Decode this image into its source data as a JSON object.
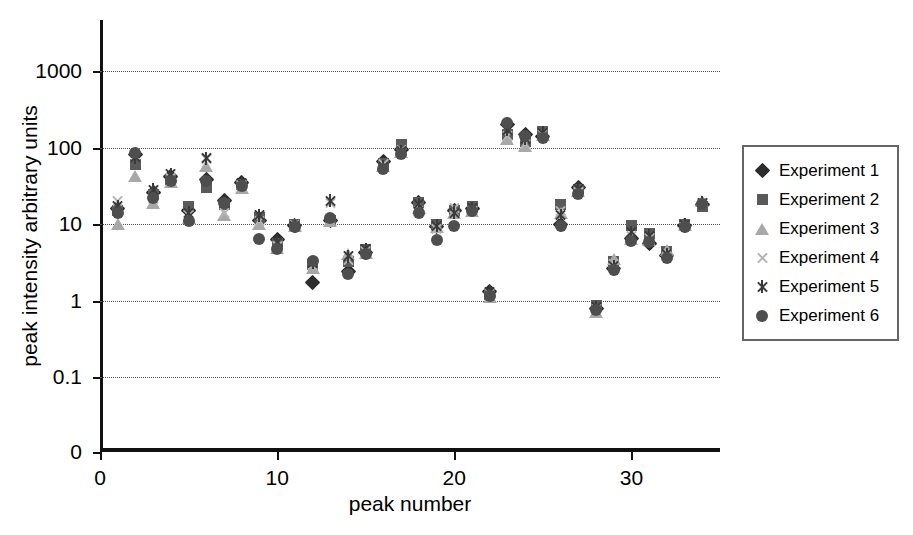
{
  "chart_data": {
    "type": "scatter",
    "title": "",
    "xlabel": "peak number",
    "ylabel": "peak intensity arbitrary units",
    "yscale": "log",
    "ylim": [
      0.03,
      3000
    ],
    "ytick_labels": [
      "1000",
      "100",
      "10",
      "1",
      "0.1",
      "0"
    ],
    "ytick_values": [
      1000,
      100,
      10,
      1,
      0.1,
      0
    ],
    "xlim": [
      0,
      35
    ],
    "xtick_labels": [
      "0",
      "10",
      "20",
      "30"
    ],
    "xtick_values": [
      0,
      10,
      20,
      30
    ],
    "grid": true,
    "grid_axis": "y",
    "legend_position": "right",
    "x": [
      1,
      2,
      3,
      4,
      5,
      6,
      7,
      8,
      9,
      10,
      11,
      12,
      13,
      14,
      15,
      16,
      17,
      18,
      19,
      20,
      21,
      22,
      23,
      24,
      25,
      26,
      27,
      28,
      29,
      30,
      31,
      32,
      33,
      34
    ],
    "series": [
      {
        "name": "Experiment 1",
        "marker": "diamond",
        "color": "#2c2c2c",
        "values": [
          16,
          80,
          26,
          42,
          15,
          38,
          20,
          35,
          11,
          6.3,
          9.5,
          1.7,
          11,
          2.4,
          4.3,
          65,
          95,
          19,
          9.2,
          15,
          16,
          1.3,
          200,
          150,
          140,
          10,
          30,
          0.78,
          2.6,
          6.5,
          5.6,
          3.9,
          9.5,
          18
        ]
      },
      {
        "name": "Experiment 2",
        "marker": "square",
        "color": "#5a5a5a",
        "values": [
          15,
          60,
          24,
          38,
          17,
          30,
          18,
          33,
          12,
          5.6,
          9.8,
          3.0,
          11,
          3.2,
          4.6,
          62,
          110,
          19,
          10,
          15,
          17,
          1.2,
          150,
          120,
          160,
          18,
          28,
          0.85,
          3.2,
          9.5,
          7.5,
          4.4,
          10,
          17
        ]
      },
      {
        "name": "Experiment 3",
        "marker": "triangle",
        "color": "#a8a8a8",
        "values": [
          10,
          43,
          19,
          35,
          12,
          58,
          13,
          30,
          10,
          4.9,
          9.3,
          2.7,
          11,
          4.0,
          4.2,
          58,
          88,
          16,
          9.1,
          14,
          15,
          1.1,
          130,
          105,
          145,
          14,
          27,
          0.7,
          3.5,
          6.4,
          6.2,
          4.6,
          9.6,
          20
        ]
      },
      {
        "name": "Experiment 4",
        "marker": "x",
        "color": "#b5b5b5",
        "values": [
          20,
          78,
          21,
          40,
          13,
          70,
          14,
          32,
          11,
          5.2,
          9.6,
          2.9,
          19,
          3.4,
          4.5,
          60,
          92,
          15,
          8.5,
          16,
          15,
          1.25,
          140,
          110,
          150,
          15,
          26,
          0.8,
          3.0,
          7.0,
          6.5,
          4.1,
          9.4,
          19
        ]
      },
      {
        "name": "Experiment 5",
        "marker": "star",
        "color": "#3a3a3a",
        "values": [
          17,
          75,
          28,
          45,
          14,
          72,
          19,
          34,
          13,
          5.8,
          9.4,
          3.1,
          20,
          3.8,
          4.7,
          56,
          90,
          18,
          9.5,
          14,
          16,
          1.3,
          170,
          130,
          155,
          13,
          29,
          0.82,
          2.8,
          7.8,
          7.0,
          4.0,
          9.8,
          19
        ]
      },
      {
        "name": "Experiment 6",
        "marker": "circle",
        "color": "#4e4e4e",
        "values": [
          14,
          85,
          22,
          37,
          11,
          36,
          19,
          31,
          6.4,
          4.7,
          9.2,
          3.3,
          12,
          2.2,
          4.0,
          53,
          82,
          14,
          6.2,
          9.5,
          15,
          1.15,
          210,
          140,
          135,
          9.3,
          25,
          0.75,
          2.5,
          6.0,
          5.8,
          3.6,
          9.2,
          18
        ]
      }
    ]
  },
  "legend": {
    "items": [
      {
        "label": "Experiment 1",
        "marker": "diamond"
      },
      {
        "label": "Experiment 2",
        "marker": "square"
      },
      {
        "label": "Experiment 3",
        "marker": "triangle"
      },
      {
        "label": "Experiment 4",
        "marker": "x"
      },
      {
        "label": "Experiment 5",
        "marker": "star"
      },
      {
        "label": "Experiment 6",
        "marker": "circle"
      }
    ]
  }
}
